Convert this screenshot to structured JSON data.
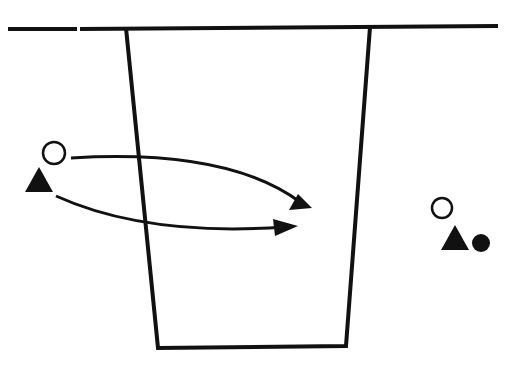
{
  "diagram": {
    "type": "drill-diagram",
    "colors": {
      "ink": "#111111",
      "background": "#ffffff"
    },
    "court": {
      "baseline": {
        "x1": 8,
        "y1": 29,
        "x2": 498,
        "y2": 26
      },
      "key": {
        "top_left": [
          126,
          28
        ],
        "top_right": [
          370,
          27
        ],
        "bottom_left": [
          158,
          348
        ],
        "bottom_right": [
          346,
          346
        ]
      }
    },
    "players": [
      {
        "id": "offense-left",
        "shape": "open-circle",
        "x": 54,
        "y": 153,
        "r": 11
      },
      {
        "id": "defense-left",
        "shape": "filled-triangle",
        "x": 39,
        "y": 181,
        "size": 28
      },
      {
        "id": "offense-right",
        "shape": "open-circle",
        "x": 442,
        "y": 208,
        "r": 11
      },
      {
        "id": "defense-right",
        "shape": "filled-triangle",
        "x": 456,
        "y": 238,
        "size": 28
      },
      {
        "id": "ball",
        "shape": "filled-circle",
        "x": 481,
        "y": 243,
        "r": 9
      }
    ],
    "arrows": [
      {
        "id": "circle-path",
        "from": [
          71,
          158
        ],
        "control": [
          220,
          145
        ],
        "to": [
          312,
          207
        ]
      },
      {
        "id": "triangle-path",
        "from": [
          56,
          196
        ],
        "control": [
          150,
          240
        ],
        "to": [
          298,
          226
        ]
      }
    ]
  }
}
